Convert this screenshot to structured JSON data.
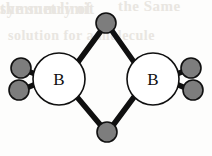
{
  "figure": {
    "name": "diborane-structure",
    "background_color": "#fdfdfc"
  },
  "colors": {
    "bond": "#101010",
    "boron_fill": "#ffffff",
    "boron_stroke": "#101010",
    "hydrogen_fill": "#7d7d7d",
    "hydrogen_stroke": "#101010",
    "label": "#101010",
    "ghost": "#e9e6e1"
  },
  "geometry": {
    "boron_radius": 26,
    "hydrogen_radius": 10,
    "bond_width": 5.5,
    "outline_width": 1.6
  },
  "atoms": [
    {
      "id": "B-left",
      "element": "B",
      "label": "B",
      "x": 59,
      "y": 79,
      "kind": "boron"
    },
    {
      "id": "B-right",
      "element": "B",
      "label": "B",
      "x": 153,
      "y": 79,
      "kind": "boron"
    },
    {
      "id": "H-bridge-top",
      "element": "H",
      "label": "",
      "x": 106,
      "y": 23,
      "kind": "hydrogen-bridge"
    },
    {
      "id": "H-bridge-bottom",
      "element": "H",
      "label": "",
      "x": 107,
      "y": 132,
      "kind": "hydrogen-bridge"
    },
    {
      "id": "H-term-upper-left",
      "element": "H",
      "label": "",
      "x": 21,
      "y": 68,
      "kind": "hydrogen-terminal"
    },
    {
      "id": "H-term-lower-left",
      "element": "H",
      "label": "",
      "x": 19,
      "y": 90,
      "kind": "hydrogen-terminal"
    },
    {
      "id": "H-term-upper-right",
      "element": "H",
      "label": "",
      "x": 191,
      "y": 68,
      "kind": "hydrogen-terminal"
    },
    {
      "id": "H-term-lower-right",
      "element": "H",
      "label": "",
      "x": 193,
      "y": 90,
      "kind": "hydrogen-terminal"
    }
  ],
  "bonds": [
    {
      "id": "bond-bl-htop",
      "from": "B-left",
      "to": "H-bridge-top",
      "x1": 78,
      "y1": 62,
      "x2": 103,
      "y2": 28,
      "type": "bridge"
    },
    {
      "id": "bond-br-htop",
      "from": "B-right",
      "to": "H-bridge-top",
      "x1": 134,
      "y1": 62,
      "x2": 110,
      "y2": 28,
      "type": "bridge"
    },
    {
      "id": "bond-bl-hbot",
      "from": "B-left",
      "to": "H-bridge-bottom",
      "x1": 77,
      "y1": 97,
      "x2": 103,
      "y2": 128,
      "type": "bridge"
    },
    {
      "id": "bond-br-hbot",
      "from": "B-right",
      "to": "H-bridge-bottom",
      "x1": 134,
      "y1": 97,
      "x2": 111,
      "y2": 128,
      "type": "bridge"
    },
    {
      "id": "bond-bl-hul",
      "from": "B-left",
      "to": "H-term-upper-left",
      "x1": 48,
      "y1": 79,
      "x2": 25,
      "y2": 70,
      "type": "terminal"
    },
    {
      "id": "bond-bl-hll",
      "from": "B-left",
      "to": "H-term-lower-left",
      "x1": 48,
      "y1": 79,
      "x2": 24,
      "y2": 89,
      "type": "terminal"
    },
    {
      "id": "bond-br-hur",
      "from": "B-right",
      "to": "H-term-upper-right",
      "x1": 164,
      "y1": 79,
      "x2": 187,
      "y2": 70,
      "type": "terminal"
    },
    {
      "id": "bond-br-hlr",
      "from": "B-right",
      "to": "H-term-lower-right",
      "x1": 164,
      "y1": 79,
      "x2": 188,
      "y2": 89,
      "type": "terminal"
    }
  ],
  "labels": {
    "boron_left": "B",
    "boron_right": "B"
  },
  "ghost_text": {
    "line1": "the Same",
    "line2": "solution for a molecule",
    "line3": "limit",
    "line4": "symmetry of",
    "line5": "the sum"
  }
}
